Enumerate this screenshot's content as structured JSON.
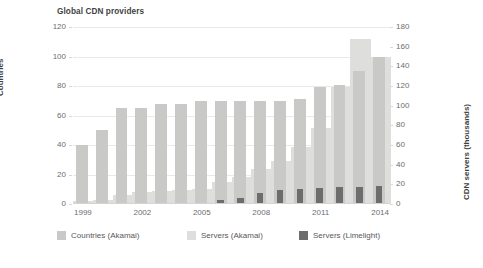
{
  "chart_data": {
    "type": "bar",
    "title": "Global CDN providers",
    "xlabel": "",
    "ylabel_left": "Countries",
    "ylabel_right": "CDN servers (thousands)",
    "grid": true,
    "legend_position": "bottom",
    "categories": [
      "1999",
      "2000",
      "2001",
      "2002",
      "2003",
      "2004",
      "2005",
      "2006",
      "2007",
      "2008",
      "2009",
      "2010",
      "2011",
      "2012",
      "2013",
      "2014"
    ],
    "xtick_labels": [
      "1999",
      "2002",
      "2005",
      "2008",
      "2011",
      "2014"
    ],
    "ylim_left": [
      0,
      120
    ],
    "ytick_labels_left": [
      "0",
      "20",
      "40",
      "60",
      "80",
      "100",
      "120"
    ],
    "ylim_right": [
      0,
      180
    ],
    "ytick_labels_right": [
      "0",
      "20",
      "40",
      "60",
      "80",
      "100",
      "120",
      "140",
      "160",
      "180"
    ],
    "series": [
      {
        "name": "Countries (Akamai)",
        "axis": "left",
        "color": "#c9c9c8",
        "values": [
          40,
          50,
          65,
          65,
          68,
          68,
          70,
          70,
          70,
          70,
          70,
          71,
          79,
          81,
          90,
          100
        ]
      },
      {
        "name": "Servers (Akamai)",
        "axis": "right",
        "color": "#dededd",
        "values": [
          3,
          4,
          9,
          12,
          13,
          14,
          15,
          22,
          27,
          36,
          44,
          58,
          77,
          119,
          168,
          150
        ]
      },
      {
        "name": "Servers (Limelight)",
        "axis": "right",
        "color": "#6d6d6d",
        "values": [
          0,
          0,
          0,
          0,
          0,
          0,
          0,
          4,
          6,
          11,
          14,
          15,
          16,
          17,
          17,
          18
        ]
      }
    ]
  },
  "legend": {
    "items": [
      {
        "label": "Countries (Akamai)"
      },
      {
        "label": "Servers (Akamai)"
      },
      {
        "label": "Servers (Limelight)"
      }
    ]
  }
}
